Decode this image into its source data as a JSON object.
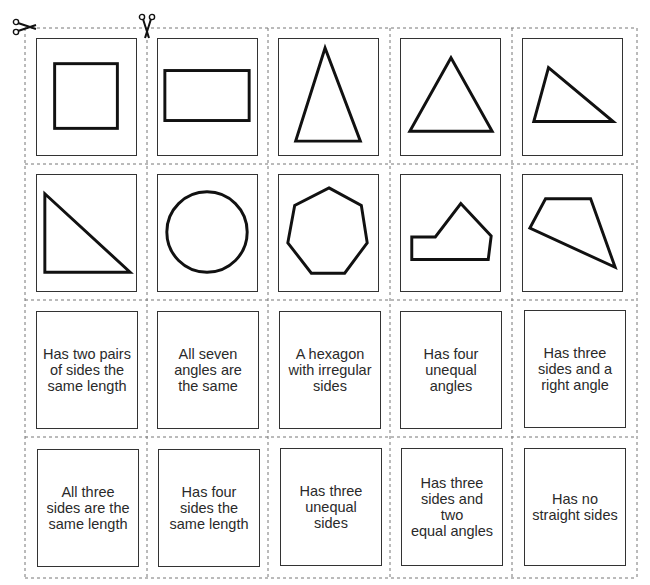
{
  "worksheet": {
    "type": "cut-out card sort",
    "cut_marks": [
      {
        "name": "scissors-icon",
        "position": "top-left",
        "orientation": "horizontal"
      },
      {
        "name": "scissors-icon",
        "position": "top",
        "orientation": "vertical"
      }
    ],
    "shape_cards": [
      {
        "row": 1,
        "col": 1,
        "shape": "square"
      },
      {
        "row": 1,
        "col": 2,
        "shape": "rectangle"
      },
      {
        "row": 1,
        "col": 3,
        "shape": "isosceles triangle (tall)"
      },
      {
        "row": 1,
        "col": 4,
        "shape": "equilateral triangle"
      },
      {
        "row": 1,
        "col": 5,
        "shape": "scalene triangle"
      },
      {
        "row": 2,
        "col": 1,
        "shape": "right-angled triangle"
      },
      {
        "row": 2,
        "col": 2,
        "shape": "circle"
      },
      {
        "row": 2,
        "col": 3,
        "shape": "regular heptagon"
      },
      {
        "row": 2,
        "col": 4,
        "shape": "irregular hexagon"
      },
      {
        "row": 2,
        "col": 5,
        "shape": "irregular quadrilateral"
      }
    ],
    "text_cards": [
      {
        "row": 3,
        "col": 1,
        "text": "Has two pairs\nof sides the\nsame length"
      },
      {
        "row": 3,
        "col": 2,
        "text": "All seven\nangles are\nthe same"
      },
      {
        "row": 3,
        "col": 3,
        "text": "A hexagon\nwith irregular\nsides"
      },
      {
        "row": 3,
        "col": 4,
        "text": "Has four\nunequal\nangles"
      },
      {
        "row": 3,
        "col": 5,
        "text": "Has three\nsides and a\nright angle"
      },
      {
        "row": 4,
        "col": 1,
        "text": "All three\nsides are the\nsame length"
      },
      {
        "row": 4,
        "col": 2,
        "text": "Has four\nsides the\nsame length"
      },
      {
        "row": 4,
        "col": 3,
        "text": "Has three\nunequal\nsides"
      },
      {
        "row": 4,
        "col": 4,
        "text": "Has three\nsides and two\nequal angles"
      },
      {
        "row": 4,
        "col": 5,
        "text": "Has no\nstraight sides"
      }
    ],
    "colors": {
      "line": "#111111",
      "card_border": "#333333",
      "dashed": "#777777",
      "background": "#ffffff"
    }
  }
}
